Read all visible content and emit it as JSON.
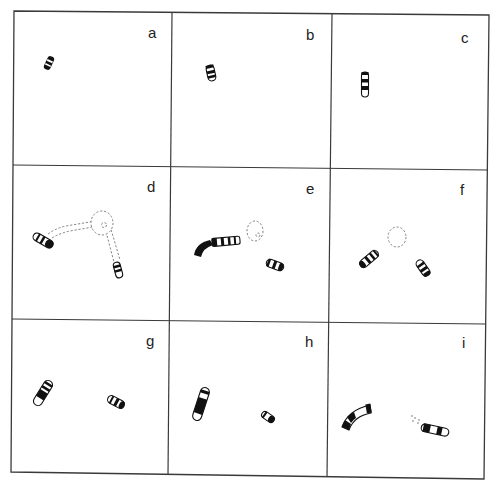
{
  "figure": {
    "layout": {
      "rows": 3,
      "cols": 3
    },
    "panels": [
      {
        "id": "a",
        "label": "a",
        "description": "single small banded chromosome segment"
      },
      {
        "id": "b",
        "label": "b",
        "description": "single small banded chromosome with rounded end"
      },
      {
        "id": "c",
        "label": "c",
        "description": "single vertical banded chromosome"
      },
      {
        "id": "d",
        "label": "d",
        "description": "two banded arms connected by dashed outline to dashed circle"
      },
      {
        "id": "e",
        "label": "e",
        "description": "long curved banded chromosome, dashed circle, short banded fragment"
      },
      {
        "id": "f",
        "label": "f",
        "description": "two banded fragments flanking dashed circle"
      },
      {
        "id": "g",
        "label": "g",
        "description": "curved banded chromosome with open end and short banded fragment"
      },
      {
        "id": "h",
        "label": "h",
        "description": "elongated banded chromosome and small fragment"
      },
      {
        "id": "i",
        "label": "i",
        "description": "curved banded chromosome and horizontal banded chromosome with faint marks"
      }
    ],
    "colors": {
      "line": "#3a3a3a",
      "band": "#111111",
      "dashed": "#777777",
      "background": "#ffffff"
    }
  }
}
